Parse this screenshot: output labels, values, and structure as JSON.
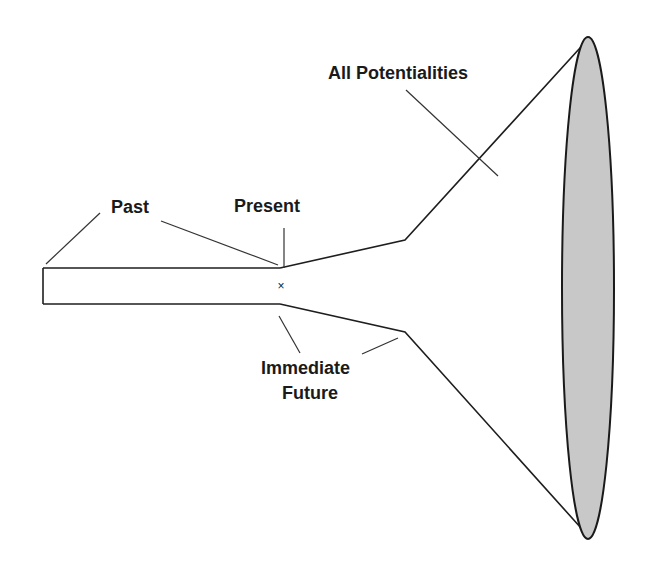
{
  "diagram": {
    "type": "timeline-funnel",
    "labels": {
      "past": "Past",
      "present": "Present",
      "immediate_future_line1": "Immediate",
      "immediate_future_line2": "Future",
      "all_potentialities": "All Potentialities"
    },
    "markers": {
      "present_point": "×"
    },
    "colors": {
      "stroke": "#1e1e1e",
      "ellipse_fill": "#c8c8c8",
      "background": "#ffffff"
    }
  }
}
